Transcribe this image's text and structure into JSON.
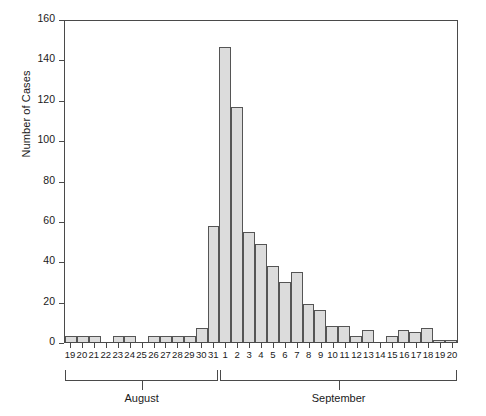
{
  "chart_data": {
    "type": "bar",
    "title": "",
    "subtitle": "",
    "xlabel": "",
    "ylabel": "Number of Cases",
    "ylim": [
      0,
      160
    ],
    "ytick_step": 20,
    "yticks": [
      0,
      20,
      40,
      60,
      80,
      100,
      120,
      140,
      160
    ],
    "grid": false,
    "legend": null,
    "bar_fill_color": "#dcdcdc",
    "bar_edge_color": "#555555",
    "axis_color": "#4a4a4a",
    "categories": [
      "19",
      "20",
      "21",
      "22",
      "23",
      "24",
      "25",
      "26",
      "27",
      "28",
      "29",
      "30",
      "31",
      "1",
      "2",
      "3",
      "4",
      "5",
      "6",
      "7",
      "8",
      "9",
      "10",
      "11",
      "12",
      "13",
      "14",
      "15",
      "16",
      "17",
      "18",
      "19",
      "20"
    ],
    "values": [
      3,
      3,
      3,
      0,
      3,
      3,
      0,
      3,
      3,
      3,
      3,
      7,
      58,
      147,
      117,
      55,
      49,
      38,
      30,
      35,
      19,
      16,
      8,
      8,
      3,
      6,
      0,
      3,
      6,
      5,
      7,
      1,
      1
    ],
    "groups": [
      {
        "label": "August",
        "start_index": 0,
        "end_index": 12
      },
      {
        "label": "September",
        "start_index": 13,
        "end_index": 32
      }
    ]
  }
}
